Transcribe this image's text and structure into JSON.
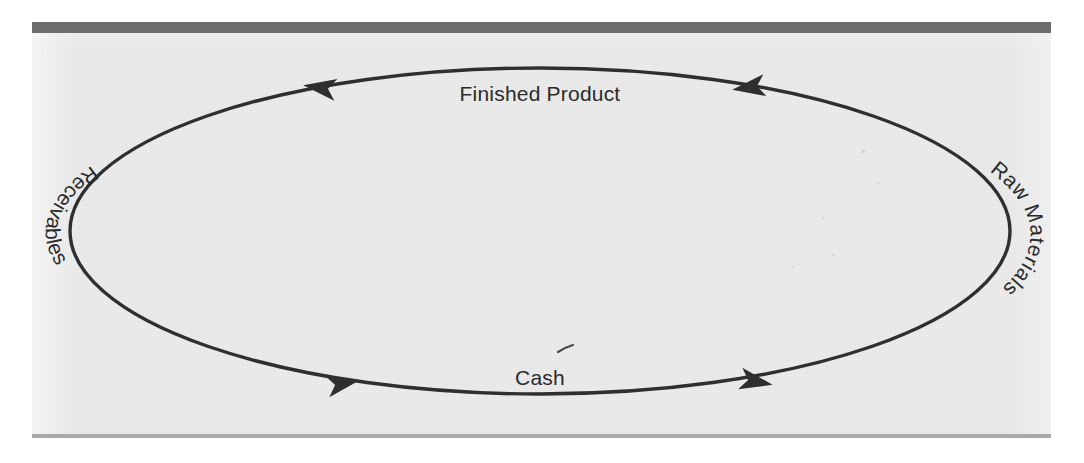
{
  "figure": {
    "shape": "ellipse",
    "flow_direction": "clockwise"
  },
  "colors": {
    "panel_background": "#e3e3e3",
    "page_background": "#ffffff",
    "top_rule": "#6d6d6d",
    "bottom_rule": "#a9a9a9",
    "ink": "#2f2f2f",
    "label_text": "#2b2b2b"
  },
  "labels": {
    "top": "Finished Product",
    "right": "Raw Materials",
    "bottom": "Cash",
    "left": "Receivables"
  },
  "nodes": [
    {
      "id": "cash",
      "label": "Cash",
      "position": "bottom"
    },
    {
      "id": "raw-materials",
      "label": "Raw Materials",
      "position": "right"
    },
    {
      "id": "finished-product",
      "label": "Finished Product",
      "position": "top"
    },
    {
      "id": "receivables",
      "label": "Receivables",
      "position": "left"
    }
  ],
  "arrows": [
    {
      "id": "arrow-top-left",
      "position": "top-left",
      "direction": "left",
      "segment": "Finished Product"
    },
    {
      "id": "arrow-top-right",
      "position": "top-right",
      "direction": "left",
      "segment": "Finished Product"
    },
    {
      "id": "arrow-bottom-left",
      "position": "bottom-left",
      "direction": "right",
      "segment": "Cash"
    },
    {
      "id": "arrow-bottom-right",
      "position": "bottom-right",
      "direction": "right",
      "segment": "Cash"
    }
  ],
  "geometry": {
    "center_x": 540,
    "center_y": 231,
    "radius_x": 470,
    "radius_y": 164
  }
}
